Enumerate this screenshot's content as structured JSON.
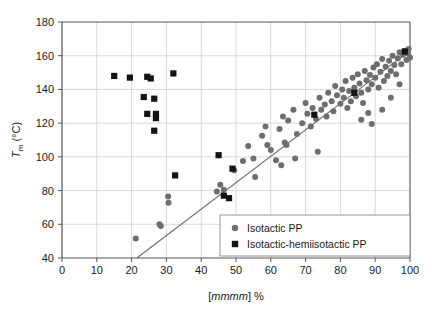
{
  "chart_data": {
    "type": "scatter",
    "title": "",
    "xlabel": "[mmmm] %",
    "ylabel": "Tm (°C)",
    "ylabel_parts": {
      "symbol": "T",
      "subscript": "m",
      "unit": "(°C)"
    },
    "xlim": [
      0,
      100
    ],
    "ylim": [
      40,
      180
    ],
    "xticks": [
      0,
      10,
      20,
      30,
      40,
      50,
      60,
      70,
      80,
      90,
      100
    ],
    "yticks": [
      40,
      60,
      80,
      100,
      120,
      140,
      160,
      180
    ],
    "grid": true,
    "grid_color": "#c8c8c8",
    "axis_color": "#555555",
    "legend_position": "lower-right",
    "series": [
      {
        "name": "Isotactic PP",
        "marker": "circle",
        "color": "#6e6e6e",
        "points": [
          [
            21.2,
            51.5
          ],
          [
            30.5,
            76.5
          ],
          [
            30.6,
            72.8
          ],
          [
            28.0,
            60.0
          ],
          [
            28.4,
            59.0
          ],
          [
            44.5,
            79.5
          ],
          [
            45.5,
            83.5
          ],
          [
            46.5,
            80.5
          ],
          [
            49.5,
            92.0
          ],
          [
            52.0,
            97.5
          ],
          [
            53.5,
            106.5
          ],
          [
            55.0,
            99.0
          ],
          [
            57.5,
            112.5
          ],
          [
            58.5,
            118.0
          ],
          [
            59.0,
            107.0
          ],
          [
            60.0,
            104.0
          ],
          [
            61.5,
            98.0
          ],
          [
            62.5,
            116.5
          ],
          [
            63.5,
            124.0
          ],
          [
            64.0,
            108.5
          ],
          [
            64.5,
            107.0
          ],
          [
            65.0,
            121.5
          ],
          [
            66.5,
            128.0
          ],
          [
            67.5,
            113.5
          ],
          [
            69.0,
            120.0
          ],
          [
            70.0,
            132.0
          ],
          [
            70.5,
            125.5
          ],
          [
            71.5,
            118.0
          ],
          [
            72.0,
            129.0
          ],
          [
            73.0,
            122.5
          ],
          [
            74.0,
            135.0
          ],
          [
            74.5,
            128.0
          ],
          [
            75.5,
            131.0
          ],
          [
            76.0,
            124.0
          ],
          [
            76.5,
            138.0
          ],
          [
            77.5,
            133.0
          ],
          [
            78.0,
            127.0
          ],
          [
            78.5,
            142.0
          ],
          [
            79.0,
            136.5
          ],
          [
            80.0,
            131.5
          ],
          [
            80.5,
            140.0
          ],
          [
            81.0,
            135.0
          ],
          [
            81.5,
            145.0
          ],
          [
            82.0,
            129.0
          ],
          [
            82.5,
            139.0
          ],
          [
            83.0,
            133.0
          ],
          [
            83.5,
            147.0
          ],
          [
            84.0,
            141.0
          ],
          [
            84.5,
            136.0
          ],
          [
            85.0,
            149.0
          ],
          [
            85.5,
            143.5
          ],
          [
            86.0,
            138.0
          ],
          [
            86.5,
            132.0
          ],
          [
            87.0,
            151.0
          ],
          [
            87.5,
            145.5
          ],
          [
            88.0,
            140.0
          ],
          [
            88.5,
            148.5
          ],
          [
            89.0,
            143.0
          ],
          [
            89.5,
            153.0
          ],
          [
            90.0,
            147.0
          ],
          [
            90.5,
            155.0
          ],
          [
            91.0,
            141.0
          ],
          [
            91.5,
            150.5
          ],
          [
            92.0,
            158.0
          ],
          [
            92.5,
            145.0
          ],
          [
            93.0,
            153.5
          ],
          [
            93.5,
            148.0
          ],
          [
            94.0,
            157.0
          ],
          [
            94.5,
            151.0
          ],
          [
            95.0,
            160.0
          ],
          [
            95.5,
            154.5
          ],
          [
            96.0,
            149.0
          ],
          [
            96.5,
            158.5
          ],
          [
            97.0,
            162.0
          ],
          [
            97.5,
            155.0
          ],
          [
            98.0,
            160.5
          ],
          [
            98.5,
            163.0
          ],
          [
            99.0,
            157.5
          ],
          [
            99.3,
            161.5
          ],
          [
            99.6,
            164.0
          ],
          [
            100.0,
            159.0
          ],
          [
            86.0,
            122.0
          ],
          [
            88.0,
            126.0
          ],
          [
            89.0,
            119.5
          ],
          [
            92.0,
            128.0
          ],
          [
            94.5,
            135.0
          ],
          [
            97.0,
            143.0
          ],
          [
            73.5,
            103.0
          ],
          [
            67.0,
            99.0
          ],
          [
            63.0,
            95.0
          ],
          [
            55.5,
            88.0
          ]
        ]
      },
      {
        "name": "Isotactic-hemiisotactic PP",
        "marker": "square",
        "color": "#141414",
        "points": [
          [
            15.0,
            148.0
          ],
          [
            19.5,
            147.0
          ],
          [
            24.5,
            147.5
          ],
          [
            25.5,
            146.5
          ],
          [
            32.0,
            149.5
          ],
          [
            23.5,
            135.5
          ],
          [
            26.5,
            134.5
          ],
          [
            24.5,
            125.5
          ],
          [
            27.0,
            125.5
          ],
          [
            27.0,
            123.0
          ],
          [
            26.5,
            115.5
          ],
          [
            32.5,
            89.0
          ],
          [
            45.0,
            101.0
          ],
          [
            49.0,
            93.0
          ],
          [
            46.5,
            77.0
          ],
          [
            48.0,
            75.5
          ],
          [
            72.5,
            125.0
          ],
          [
            84.0,
            138.0
          ],
          [
            98.5,
            162.5
          ]
        ]
      }
    ],
    "trendline": {
      "color": "#6e6e6e",
      "x_start": 21.5,
      "y_start": 40.0,
      "x_end": 100.0,
      "y_end": 163.0
    },
    "legend": {
      "items": [
        {
          "label": "Isotactic PP",
          "marker": "circle",
          "color": "#6e6e6e"
        },
        {
          "label": "Isotactic-hemiisotactic PP",
          "marker": "square",
          "color": "#141414"
        }
      ]
    }
  }
}
